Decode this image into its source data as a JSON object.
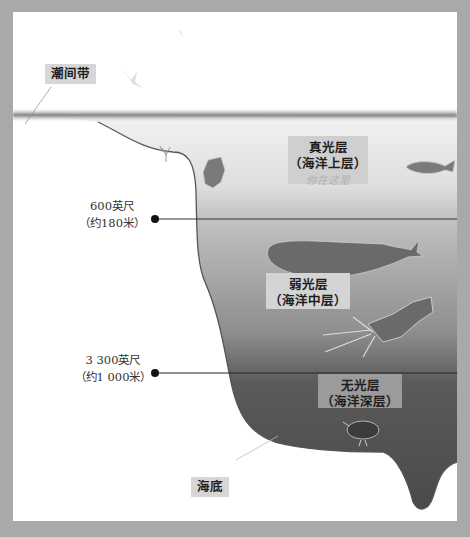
{
  "diagram": {
    "callouts": {
      "intertidal": "潮间带",
      "seafloor": "海底"
    },
    "zones": [
      {
        "name": "真光层",
        "subname": "（海洋上层）",
        "note": "你在这里",
        "color": "#e6e6e6"
      },
      {
        "name": "弱光层",
        "subname": "（海洋中层）",
        "color": "#9a9a9a"
      },
      {
        "name": "无光层",
        "subname": "（海洋深层）",
        "color": "#4e4e4e"
      }
    ],
    "depth_markers": [
      {
        "imperial": "600英尺",
        "metric": "（约180米）"
      },
      {
        "imperial": "3 300英尺",
        "metric": "（约1 000米）"
      }
    ],
    "creatures": [
      "coral",
      "squid",
      "sea-turtle",
      "fish",
      "sperm-whale",
      "giant-squid",
      "anglerfish",
      "bird"
    ]
  }
}
